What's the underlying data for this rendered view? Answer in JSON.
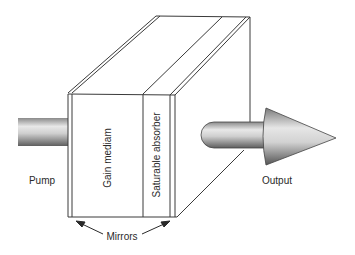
{
  "diagram": {
    "type": "laser-cavity-schematic",
    "labels": {
      "pump": "Pump",
      "output": "Output",
      "gain_medium": "Gain mediam",
      "saturable_absorber": "Saturable absorber",
      "mirrors": "Mirrors"
    },
    "components": [
      {
        "id": "pump-beam",
        "label": "Pump",
        "shape": "cylinder"
      },
      {
        "id": "gain-medium",
        "label": "Gain mediam",
        "shape": "block-section"
      },
      {
        "id": "saturable-absorber",
        "label": "Saturable absorber",
        "shape": "block-section"
      },
      {
        "id": "mirror-left",
        "label": "Mirrors",
        "shape": "thin-plate"
      },
      {
        "id": "mirror-right",
        "label": "Mirrors",
        "shape": "thin-plate"
      },
      {
        "id": "output-beam",
        "label": "Output",
        "shape": "arrow"
      }
    ],
    "colors": {
      "line": "#3a3a3a",
      "background": "#ffffff",
      "beam_light": "#f2f2f2",
      "beam_dark": "#6e6e6e"
    }
  }
}
